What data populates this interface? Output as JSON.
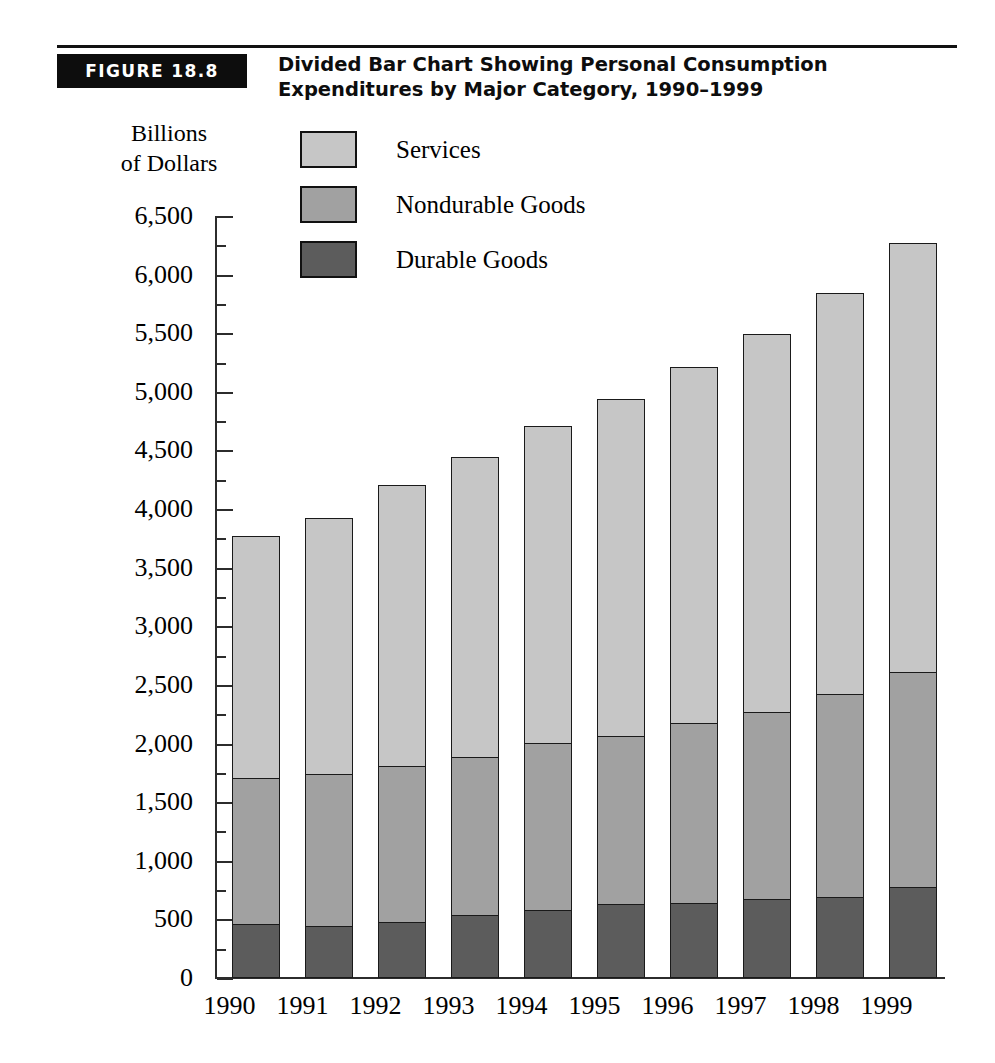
{
  "figure": {
    "badge": "FIGURE 18.8",
    "title": "Divided Bar Chart Showing Personal Consumption\nExpenditures by Major Category, 1990–1999"
  },
  "axis_title": "Billions\nof Dollars",
  "legend": {
    "position": "top-left-inside",
    "entries": [
      {
        "label": "Services",
        "color": "#c6c6c6",
        "swatch": "services-swatch"
      },
      {
        "label": "Nondurable Goods",
        "color": "#a1a1a1",
        "swatch": "nondurable-swatch"
      },
      {
        "label": "Durable Goods",
        "color": "#5c5c5c",
        "swatch": "durable-swatch"
      }
    ]
  },
  "ytick_labels": [
    "6,500",
    "6,000",
    "5,500",
    "5,000",
    "4,500",
    "4,000",
    "3,500",
    "3,000",
    "2,500",
    "2,000",
    "1,500",
    "1,000",
    "500",
    "0"
  ],
  "chart_data": {
    "type": "bar",
    "subtype": "stacked-vertical",
    "title": "Divided Bar Chart Showing Personal Consumption Expenditures by Major Category, 1990–1999",
    "xlabel": "",
    "ylabel": "Billions of Dollars",
    "ylim": [
      0,
      6500
    ],
    "ytick_step": 500,
    "yminor_step": 250,
    "grid": false,
    "legend_position": "upper-left",
    "categories": [
      "1990",
      "1991",
      "1992",
      "1993",
      "1994",
      "1995",
      "1996",
      "1997",
      "1998",
      "1999"
    ],
    "series": [
      {
        "name": "Durable Goods",
        "color": "#5c5c5c",
        "values": [
          460,
          440,
          480,
          535,
          580,
          630,
          640,
          675,
          695,
          780
        ]
      },
      {
        "name": "Nondurable Goods",
        "color": "#a1a1a1",
        "values": [
          1260,
          1310,
          1340,
          1365,
          1435,
          1450,
          1545,
          1605,
          1745,
          1840
        ]
      },
      {
        "name": "Services",
        "color": "#c6c6c6",
        "values": [
          2080,
          2200,
          2410,
          2570,
          2725,
          2890,
          3055,
          3240,
          3430,
          3680
        ]
      }
    ],
    "stack_tops": {
      "Durable Goods": [
        460,
        440,
        480,
        535,
        580,
        630,
        640,
        675,
        695,
        780
      ],
      "Nondurable Goods": [
        1720,
        1750,
        1820,
        1900,
        2015,
        2080,
        2185,
        2280,
        2440,
        2620
      ],
      "Services": [
        3800,
        3950,
        4230,
        4470,
        4740,
        4970,
        5240,
        5520,
        5870,
        6300
      ]
    },
    "totals": [
      3800,
      3950,
      4230,
      4470,
      4740,
      4970,
      5240,
      5520,
      5870,
      6300
    ]
  }
}
